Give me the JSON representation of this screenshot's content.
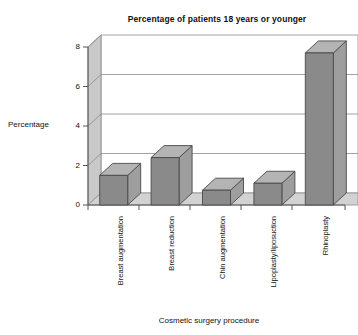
{
  "chart_data": {
    "type": "bar",
    "title": "Percentage of patients  18 years or younger",
    "xlabel": "Cosmetic surgery procedure",
    "ylabel": "Percentage",
    "categories": [
      "Breast augmentation",
      "Breast reduction",
      "Chin augmentation",
      "Lipoplasty/liposuction",
      "Rhinoplasty"
    ],
    "values": [
      1.5,
      2.4,
      0.75,
      1.1,
      7.7
    ],
    "ylim": [
      0,
      8
    ],
    "yticks": [
      "0",
      "2",
      "4",
      "6",
      "8"
    ],
    "ytick_values": [
      0,
      2,
      4,
      6,
      8
    ],
    "grid": true,
    "legend": false,
    "style": "3d-column",
    "colors": {
      "bar_front": "#8a8a8a",
      "bar_top": "#b4b4b4",
      "bar_side": "#9e9e9e",
      "bar_outline": "#4a4a4a",
      "wall_back": "#ffffff",
      "wall_left": "#c9c9c9",
      "floor": "#d2d2d2",
      "gridline": "#8c8c8c",
      "axis": "#555555",
      "text": "#111111"
    }
  }
}
